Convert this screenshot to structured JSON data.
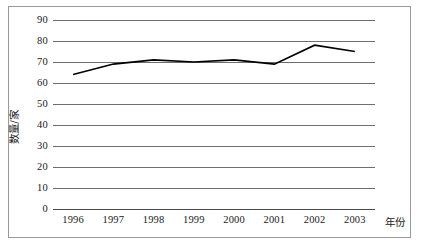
{
  "chart_data": {
    "type": "line",
    "title": "",
    "xlabel": "年份",
    "ylabel": "数量/家",
    "categories": [
      "1996",
      "1997",
      "1998",
      "1999",
      "2000",
      "2001",
      "2002",
      "2003"
    ],
    "x": [
      1996,
      1997,
      1998,
      1999,
      2000,
      2001,
      2002,
      2003
    ],
    "series": [
      {
        "name": "数量/家",
        "values": [
          64,
          69,
          71,
          70,
          71,
          69,
          78,
          75
        ],
        "color": "#000000",
        "marker": "none",
        "linewidth": 1.6
      }
    ],
    "ylim": [
      0,
      90
    ],
    "yticks": [
      0,
      10,
      20,
      30,
      40,
      50,
      60,
      70,
      80,
      90
    ],
    "ytick_labels": [
      "0",
      "10",
      "20",
      "30",
      "40",
      "50",
      "60",
      "70",
      "80",
      "90"
    ],
    "xtick_labels": [
      "1996",
      "1997",
      "1998",
      "1999",
      "2000",
      "2001",
      "2002",
      "2003"
    ],
    "grid": "horizontal",
    "grid_color": "#6e6e6e",
    "legend": "none",
    "background": "#ffffff",
    "frame_color": "#9a9a9a"
  }
}
